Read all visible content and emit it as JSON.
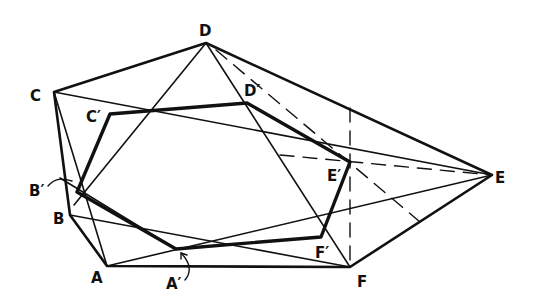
{
  "diagram": {
    "title": "",
    "ink_color": "#111111",
    "outer_hexagon": {
      "label": "ABCDEF",
      "vertices": {
        "A": [
          107,
          266
        ],
        "B": [
          70,
          215
        ],
        "C": [
          54,
          92
        ],
        "D": [
          206,
          43
        ],
        "E": [
          492,
          175
        ],
        "F": [
          350,
          267
        ]
      }
    },
    "inner_hexagon": {
      "label": "A'B'C'D'E'F'",
      "vertices": {
        "A'": [
          176,
          249
        ],
        "B'": [
          77,
          192
        ],
        "C'": [
          110,
          114
        ],
        "D'": [
          247,
          103
        ],
        "E'": [
          350,
          162
        ],
        "F'": [
          321,
          237
        ]
      }
    },
    "labels": [
      {
        "text": "D",
        "x": 199,
        "y": 36
      },
      {
        "text": "C",
        "x": 30,
        "y": 101
      },
      {
        "text": "C′",
        "x": 86,
        "y": 122
      },
      {
        "text": "D′",
        "x": 244,
        "y": 96
      },
      {
        "text": "B′",
        "x": 29,
        "y": 196
      },
      {
        "text": "B",
        "x": 53,
        "y": 224
      },
      {
        "text": "A",
        "x": 91,
        "y": 283
      },
      {
        "text": "A′",
        "x": 166,
        "y": 289
      },
      {
        "text": "E′",
        "x": 327,
        "y": 181
      },
      {
        "text": "F′",
        "x": 315,
        "y": 258
      },
      {
        "text": "F",
        "x": 357,
        "y": 287
      },
      {
        "text": "E",
        "x": 495,
        "y": 183
      }
    ]
  }
}
